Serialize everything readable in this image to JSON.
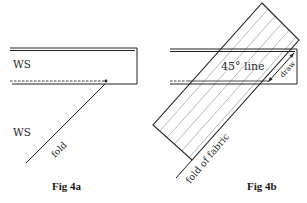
{
  "figures": [
    {
      "id": "fig-4a",
      "caption": "Fig 4a",
      "labels": {
        "upper_ws": "WS",
        "lower_ws": "WS",
        "fold": "fold"
      }
    },
    {
      "id": "fig-4b",
      "caption": "Fig 4b",
      "labels": {
        "line_45": "45° line",
        "draw": "draw",
        "fold_of_fabric": "fold of fabric"
      }
    }
  ],
  "colors": {
    "line": "#222222",
    "hatch": "#9a9a9a",
    "background": "#ffffff"
  }
}
